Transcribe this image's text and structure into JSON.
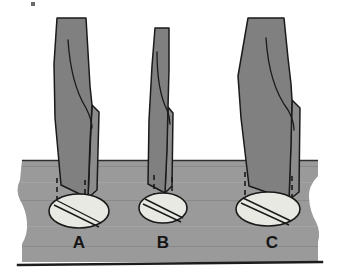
{
  "figure": {
    "background_color": "#ffffff",
    "surface": {
      "name": "workpiece-surface",
      "fill": "#9a9a9a",
      "stroke": "#2b2b2b",
      "top_edge_y": 160,
      "bottom_edge_y": 262,
      "baseline_color": "#1c1c1c",
      "edge_style": "wavy-torn"
    },
    "tool_fill": "#808080",
    "tool_stroke": "#1a1a1a",
    "tool_side_fill": "#8c8c8c",
    "cut_fill": "#e9e9e4",
    "cut_stroke": "#1a1a1a",
    "dash_color": "#1a1a1a",
    "label_color": "#151515"
  },
  "tools": [
    {
      "id": "tool-a",
      "label": "A",
      "label_x": 79,
      "label_y": 248,
      "width_class": "medium",
      "shank_top_y": 18,
      "tip_y": 198,
      "cut": {
        "name": "cut-ellipse-a",
        "cx": 79,
        "cy": 211,
        "rx": 30,
        "ry": 17,
        "groove_count": 2
      },
      "dashes": [
        {
          "x": 57,
          "y1": 178,
          "y2": 212
        },
        {
          "x": 85,
          "y1": 180,
          "y2": 216
        }
      ]
    },
    {
      "id": "tool-b",
      "label": "B",
      "label_x": 163,
      "label_y": 248,
      "width_class": "narrow",
      "shank_top_y": 28,
      "tip_y": 193,
      "cut": {
        "name": "cut-ellipse-b",
        "cx": 163,
        "cy": 208,
        "rx": 24,
        "ry": 15,
        "groove_count": 2
      },
      "dashes": [
        {
          "x": 154,
          "y1": 175,
          "y2": 208
        },
        {
          "x": 172,
          "y1": 177,
          "y2": 212
        }
      ]
    },
    {
      "id": "tool-c",
      "label": "C",
      "label_x": 272,
      "label_y": 248,
      "width_class": "wide",
      "shank_top_y": 18,
      "tip_y": 200,
      "cut": {
        "name": "cut-ellipse-c",
        "cx": 268,
        "cy": 209,
        "rx": 32,
        "ry": 17,
        "groove_count": 2
      },
      "dashes": [
        {
          "x": 245,
          "y1": 172,
          "y2": 208
        },
        {
          "x": 292,
          "y1": 176,
          "y2": 214
        }
      ]
    }
  ],
  "artifact": {
    "name": "scan-speck",
    "x": 31,
    "y": 2,
    "width": 4,
    "height": 4,
    "color": "#3a3a3a"
  }
}
